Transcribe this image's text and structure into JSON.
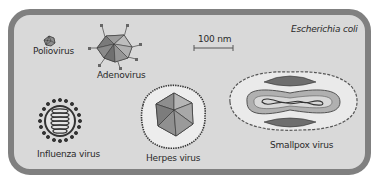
{
  "diagram": {
    "cell_label": "Escherichia coli",
    "scale_bar": {
      "label": "100 nm"
    },
    "viruses": [
      {
        "name": "Poliovirus"
      },
      {
        "name": "Adenovirus"
      },
      {
        "name": "Influenza virus"
      },
      {
        "name": "Herpes virus"
      },
      {
        "name": "Smallpox virus"
      }
    ],
    "colors": {
      "cell_fill": "#d9d9d9",
      "cell_border": "#808080",
      "capsid_dark": "#707070",
      "capsid_mid": "#9a9a9a",
      "capsid_light": "#bcbcbc",
      "envelope_fill": "#ececec",
      "outline": "#333333"
    }
  }
}
